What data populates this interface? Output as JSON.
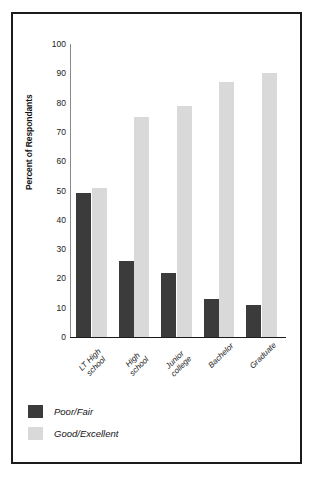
{
  "chart_data": {
    "type": "bar",
    "title": "",
    "xlabel": "",
    "ylabel": "Percent of Respondants",
    "ylim": [
      0,
      100
    ],
    "yticks": [
      100,
      90,
      80,
      70,
      60,
      50,
      40,
      30,
      20,
      10,
      0
    ],
    "grid": false,
    "legend_position": "bottom-left",
    "categories": [
      "LT High school",
      "High school",
      "Junior college",
      "Bachelor",
      "Graduate"
    ],
    "category_lines": [
      [
        "LT High",
        "school"
      ],
      [
        "High",
        "school"
      ],
      [
        "Junior",
        "college"
      ],
      [
        "Bachelor"
      ],
      [
        "Graduate"
      ]
    ],
    "series": [
      {
        "name": "Poor/Fair",
        "color": "#3b3b3b",
        "values": [
          49,
          26,
          22,
          13,
          11
        ]
      },
      {
        "name": "Good/Excellent",
        "color": "#d9d9d9",
        "values": [
          51,
          75,
          79,
          87,
          90
        ]
      }
    ]
  },
  "axis": {
    "y_title": "Percent of Respondants",
    "tick_100": "100",
    "tick_90": "90",
    "tick_80": "80",
    "tick_70": "70",
    "tick_60": "60",
    "tick_50": "50",
    "tick_40": "40",
    "tick_30": "30",
    "tick_20": "20",
    "tick_10": "10",
    "tick_0": "0"
  },
  "legend": {
    "items": [
      {
        "label": "Poor/Fair",
        "color": "#3b3b3b"
      },
      {
        "label": "Good/Excellent",
        "color": "#d9d9d9"
      }
    ]
  }
}
